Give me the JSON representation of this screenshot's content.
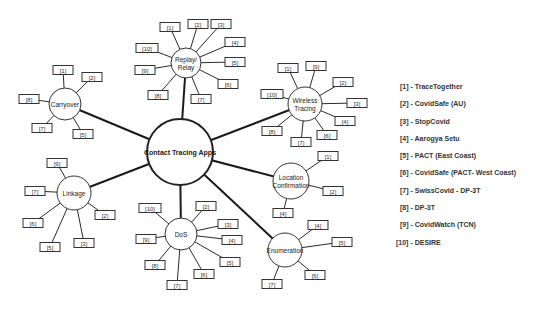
{
  "diagram": {
    "hub": {
      "label": "Contact Tracing Apps",
      "x": 180,
      "y": 152,
      "r": 33
    },
    "categories": [
      {
        "id": "replay",
        "label_lines": [
          "Replay/",
          "Relay"
        ],
        "x": 186,
        "y": 63,
        "r": 15,
        "refs": [
          {
            "label": "[1]",
            "x": 170,
            "y": 27
          },
          {
            "label": "[2]",
            "x": 198,
            "y": 24
          },
          {
            "label": "[3]",
            "x": 221,
            "y": 24
          },
          {
            "label": "[4]",
            "x": 235,
            "y": 42
          },
          {
            "label": "[5]",
            "x": 235,
            "y": 62
          },
          {
            "label": "[6]",
            "x": 228,
            "y": 84
          },
          {
            "label": "[7]",
            "x": 201,
            "y": 99
          },
          {
            "label": "[8]",
            "x": 158,
            "y": 95
          },
          {
            "label": "[9]",
            "x": 145,
            "y": 70
          },
          {
            "label": "[10]",
            "x": 147,
            "y": 48
          }
        ]
      },
      {
        "id": "carryover",
        "label_lines": [
          "Carryover"
        ],
        "x": 65,
        "y": 104,
        "r": 16,
        "refs": [
          {
            "label": "[1]",
            "x": 63,
            "y": 70
          },
          {
            "label": "[2]",
            "x": 92,
            "y": 77
          },
          {
            "label": "[8]",
            "x": 29,
            "y": 99
          },
          {
            "label": "[7]",
            "x": 42,
            "y": 128
          },
          {
            "label": "[5]",
            "x": 83,
            "y": 134
          }
        ]
      },
      {
        "id": "wireless",
        "label_lines": [
          "Wireless",
          "Tracing"
        ],
        "x": 305,
        "y": 104,
        "r": 17,
        "refs": [
          {
            "label": "[1]",
            "x": 288,
            "y": 68
          },
          {
            "label": "[9]",
            "x": 316,
            "y": 66
          },
          {
            "label": "[2]",
            "x": 343,
            "y": 82
          },
          {
            "label": "[10]",
            "x": 272,
            "y": 94
          },
          {
            "label": "[3]",
            "x": 357,
            "y": 103
          },
          {
            "label": "[4]",
            "x": 345,
            "y": 121
          },
          {
            "label": "[8]",
            "x": 272,
            "y": 131
          },
          {
            "label": "[6]",
            "x": 327,
            "y": 135
          },
          {
            "label": "[7]",
            "x": 301,
            "y": 142
          }
        ]
      },
      {
        "id": "location",
        "label_lines": [
          "Location",
          "Confirmation"
        ],
        "x": 291,
        "y": 181,
        "r": 18,
        "refs": [
          {
            "label": "[1]",
            "x": 328,
            "y": 156
          },
          {
            "label": "[2]",
            "x": 333,
            "y": 191
          },
          {
            "label": "[4]",
            "x": 283,
            "y": 213
          }
        ]
      },
      {
        "id": "enumeration",
        "label_lines": [
          "Enumeration"
        ],
        "x": 285,
        "y": 250,
        "r": 17,
        "refs": [
          {
            "label": "[4]",
            "x": 318,
            "y": 225
          },
          {
            "label": "[5]",
            "x": 342,
            "y": 242
          },
          {
            "label": "[6]",
            "x": 315,
            "y": 275
          },
          {
            "label": "[7]",
            "x": 272,
            "y": 284
          }
        ]
      },
      {
        "id": "linkage",
        "label_lines": [
          "Linkage"
        ],
        "x": 74,
        "y": 193,
        "r": 17,
        "refs": [
          {
            "label": "[9]",
            "x": 57,
            "y": 163
          },
          {
            "label": "[7]",
            "x": 35,
            "y": 191
          },
          {
            "label": "[2]",
            "x": 105,
            "y": 215
          },
          {
            "label": "[6]",
            "x": 33,
            "y": 223
          },
          {
            "label": "[3]",
            "x": 84,
            "y": 243
          },
          {
            "label": "[5]",
            "x": 50,
            "y": 247
          }
        ]
      },
      {
        "id": "dos",
        "label_lines": [
          "DoS"
        ],
        "x": 181,
        "y": 234,
        "r": 16,
        "refs": [
          {
            "label": "[10]",
            "x": 150,
            "y": 208
          },
          {
            "label": "[2]",
            "x": 206,
            "y": 206
          },
          {
            "label": "[3]",
            "x": 228,
            "y": 224
          },
          {
            "label": "[9]",
            "x": 146,
            "y": 239
          },
          {
            "label": "[4]",
            "x": 232,
            "y": 240
          },
          {
            "label": "[5]",
            "x": 230,
            "y": 262
          },
          {
            "label": "[8]",
            "x": 155,
            "y": 265
          },
          {
            "label": "[6]",
            "x": 204,
            "y": 274
          },
          {
            "label": "[7]",
            "x": 177,
            "y": 285
          }
        ]
      }
    ],
    "legend": [
      "[1] - TraceTogether",
      "[2] - CovidSafe (AU)",
      "[3] - StopCovid",
      "[4] - Aarogya Setu",
      "[5] - PACT (East Coast)",
      "[6] - CovidSafe (PACT- West Coast)",
      "[7] - SwissCovid  - DP-3T",
      "[8] - DP-3T",
      "[9] - CovidWatch (TCN)",
      "[10] - DESIRE"
    ]
  }
}
